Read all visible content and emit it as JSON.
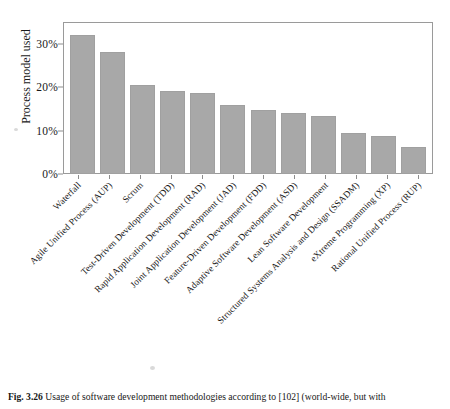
{
  "figure": {
    "caption_label": "Fig. 3.26",
    "caption_text": "Usage of software development methodologies according to [102] (world-wide, but with"
  },
  "chart_data": {
    "type": "bar",
    "title": "",
    "xlabel": "",
    "ylabel": "Process model used",
    "ylim": [
      0,
      35
    ],
    "grid": false,
    "legend": null,
    "ytick_labels": [
      "0%",
      "10%",
      "20%",
      "30%"
    ],
    "ytick_values": [
      0,
      10,
      20,
      30
    ],
    "bar_color": "#a8a8a8",
    "categories": [
      "Waterfall",
      "Agile Unified Process (AUP)",
      "Scrum",
      "Test-Driven Development (TDD)",
      "Rapid Application Development (RAD)",
      "Joint Application Development (JAD)",
      "Feature-Driven Development (FDD)",
      "Adaptive Software Development (ASD)",
      "Lean Software Development",
      "Structured Systems Analysis and Design (SSADM)",
      "eXtreme Programming (XP)",
      "Rational Unified Process (RUP)"
    ],
    "values": [
      32.0,
      28.2,
      20.5,
      19.2,
      18.6,
      16.0,
      14.7,
      14.0,
      13.3,
      9.5,
      8.8,
      6.2
    ]
  }
}
